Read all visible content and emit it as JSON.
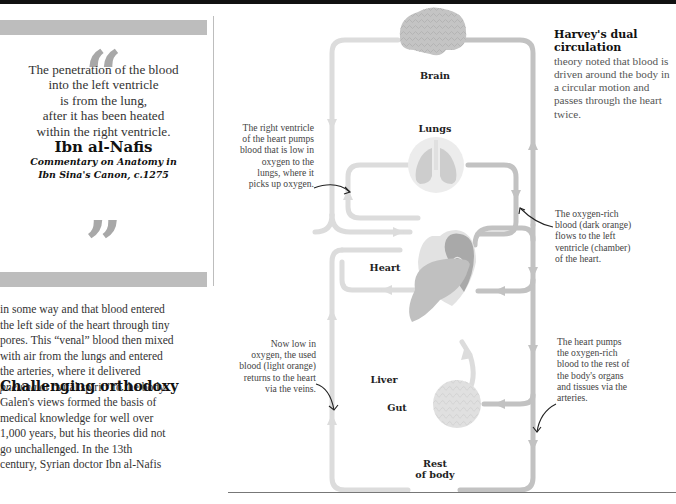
{
  "quote": {
    "open_mark": "“",
    "text_lines": [
      "The penetration of the blood",
      "into the left ventricle",
      "is from the lung,",
      "after it has been heated",
      "within the right ventricle."
    ],
    "author": "Ibn al-Nafis",
    "source_line1": "Commentary on Anatomy in",
    "source_line2": "Ibn Sina's Canon, c.1275",
    "close_mark": "”"
  },
  "body": {
    "paragraph1_lines": [
      "in some way and that blood entered",
      "the left side of the heart through tiny",
      "pores. This “venal” blood then mixed",
      "with air from the lungs and entered",
      "the arteries, where it delivered"
    ],
    "paragraph1_last_italic": "pneuma",
    "paragraph1_last_rest": " or “vital spirit” to the body.",
    "heading": "Challenging orthodoxy",
    "paragraph2_lines": [
      "Galen's views formed the basis of",
      "medical knowledge for well over",
      "1,000 years, but his theories did not",
      "go unchallenged. In the 13th",
      "century, Syrian doctor Ibn al-Nafis"
    ]
  },
  "sidebar": {
    "title": "Harvey's dual circulation",
    "text": "theory noted that blood is driven around the body in a circular motion and passes through the heart twice."
  },
  "diagram": {
    "organs": {
      "brain": "Brain",
      "lungs": "Lungs",
      "heart": "Heart",
      "liver": "Liver",
      "gut": "Gut",
      "rest_line1": "Rest",
      "rest_line2": "of body"
    },
    "annotations": {
      "right_ventricle": [
        "The right ventricle",
        "of the heart pumps",
        "blood that is low in",
        "oxygen to the",
        "lungs, where it",
        "picks up oxygen."
      ],
      "oxygen_rich": [
        "The oxygen-rich",
        "blood (dark orange)",
        "flows to the left",
        "ventricle (chamber)",
        "of the heart."
      ],
      "used_blood": [
        "Now low in",
        "oxygen, the used",
        "blood (light orange)",
        "returns to the heart",
        "via the veins."
      ],
      "heart_pumps": [
        "The heart pumps",
        "the oxygen-rich",
        "blood to the rest of",
        "the body's organs",
        "and tissues via the",
        "arteries."
      ]
    },
    "colors": {
      "light_vessel": "#dcdcdc",
      "dark_vessel": "#bcbcbc",
      "organ_light": "#e4e4e4",
      "organ_mid": "#c6c6c6",
      "organ_dark": "#9e9e9e",
      "quote_mark": "#a8a8a8",
      "band": "#bdbdbd"
    }
  }
}
